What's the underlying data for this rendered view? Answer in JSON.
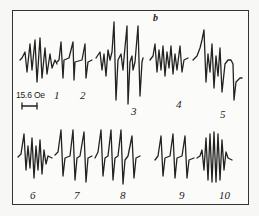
{
  "figure": {
    "panel_label": "b",
    "scale_bar": {
      "label": "15.6 Oe"
    },
    "spectra": [
      {
        "number": "1",
        "row": 1
      },
      {
        "number": "2",
        "row": 1
      },
      {
        "number": "3",
        "row": 1
      },
      {
        "number": "4",
        "row": 1
      },
      {
        "number": "5",
        "row": 1
      },
      {
        "number": "6",
        "row": 2
      },
      {
        "number": "7",
        "row": 2
      },
      {
        "number": "8",
        "row": 2
      },
      {
        "number": "9",
        "row": 2
      },
      {
        "number": "10",
        "row": 2
      }
    ],
    "colors": {
      "ink": "#222222",
      "paper": "#fbfbf9",
      "frame": "#333333"
    }
  }
}
